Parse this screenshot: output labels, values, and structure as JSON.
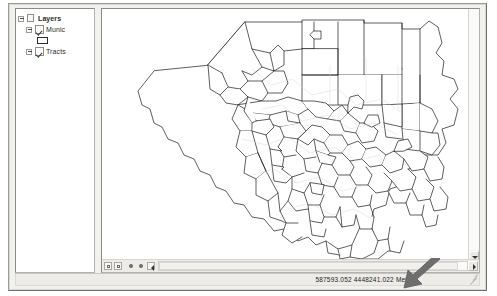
{
  "window": {
    "title": "",
    "background_color": "#f2f1ee",
    "border_color": "#9a9a96"
  },
  "toc_panel": {
    "name": "Table Of Contents",
    "tree": [
      {
        "id": "layers-root",
        "label": "Layers",
        "level": 0,
        "bold": true,
        "expander": "minus",
        "icon": "map-document-icon",
        "checked": null
      },
      {
        "id": "munic-layer",
        "label": "Munic",
        "level": 1,
        "bold": false,
        "expander": "minus",
        "icon": "checkbox-icon",
        "checked": true
      },
      {
        "id": "munic-symbol",
        "label": "",
        "level": 2,
        "bold": false,
        "expander": "none",
        "icon": "polygon-swatch-icon",
        "checked": null,
        "swatch_fill": "#ffffff",
        "swatch_outline": "#2c2c2a"
      },
      {
        "id": "tracts-layer",
        "label": "Tracts",
        "level": 1,
        "bold": false,
        "expander": "minus",
        "icon": "checkbox-icon",
        "checked": true
      }
    ]
  },
  "map": {
    "name": "Allegheny County municipalities map",
    "line_color": "#1a1a1a",
    "fill_color": "#ffffff",
    "background": "#ffffff",
    "vertical_scrollbar": {
      "name": "map-vertical-scrollbar",
      "down_arrow": "chevron-down-icon"
    },
    "horizontal_scrollbar": {
      "name": "map-horizontal-scrollbar",
      "right_arrow": "chevron-right-icon"
    },
    "mini_toolbar": [
      {
        "id": "btn-1",
        "icon": "square-icon",
        "tooltip": ""
      },
      {
        "id": "btn-2",
        "icon": "square-filled-icon",
        "tooltip": ""
      },
      {
        "id": "btn-3",
        "icon": "dot-icon",
        "tooltip": ""
      },
      {
        "id": "btn-4",
        "icon": "dot-small-icon",
        "tooltip": ""
      },
      {
        "id": "btn-5",
        "icon": "left-arrow-icon",
        "tooltip": ""
      }
    ]
  },
  "status_bar": {
    "coordinates": "587593.052  4448241.022 Meters",
    "units": "Meters",
    "x": "587593.052",
    "y": "4448241.022",
    "resize_grip": "resize-grip-icon"
  },
  "annotation": {
    "arrow": {
      "name": "callout-arrow",
      "color": "#6b6b6b",
      "direction": "down-left",
      "points_to": "coordinates readout"
    }
  }
}
